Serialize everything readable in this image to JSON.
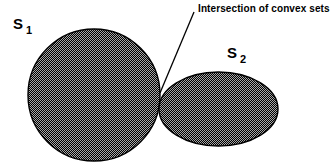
{
  "figure": {
    "title": "Intersection of convex sets",
    "background_color": "#ffffff",
    "width": 333,
    "height": 167
  },
  "annotation": {
    "text": "Intersection of convex sets",
    "leader_line": {
      "from_x": 194,
      "from_y": 12,
      "to_x": 160,
      "to_y": 93,
      "color": "#000000"
    }
  },
  "labels": {
    "set1": {
      "name": "S",
      "subscript": "1"
    },
    "set2": {
      "name": "S",
      "subscript": "2"
    }
  },
  "shapes": {
    "fill_color": "#4a4a4a",
    "stroke_color": "#000000",
    "set1": {
      "type": "circle",
      "cx": 94,
      "cy": 95,
      "r": 66
    },
    "set2": {
      "type": "ellipse",
      "cx": 218.5,
      "cy": 109,
      "rx": 59.5,
      "ry": 37
    },
    "tangent_point": {
      "x": 160,
      "y": 93
    }
  }
}
